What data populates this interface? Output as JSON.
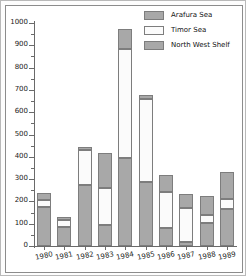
{
  "chart_data": {
    "type": "bar",
    "stacked": true,
    "title": "",
    "subtitle": "",
    "xlabel": "",
    "ylabel": "",
    "categories": [
      "1980",
      "1981",
      "1982",
      "1983",
      "1984",
      "1985",
      "1986",
      "1987",
      "1988",
      "1989"
    ],
    "series": [
      {
        "name": "North West Shelf",
        "color": "#a8a8a8",
        "values": [
          175,
          85,
          275,
          95,
          395,
          288,
          80,
          18,
          105,
          165
        ]
      },
      {
        "name": "Timor Sea",
        "color": "#fbfbfb",
        "values": [
          30,
          30,
          155,
          163,
          490,
          370,
          162,
          152,
          35,
          47
        ]
      },
      {
        "name": "Arafura Sea",
        "color": "#a8a8a8",
        "values": [
          33,
          17,
          12,
          157,
          90,
          17,
          76,
          63,
          85,
          118
        ]
      }
    ],
    "cumulative_tops": {
      "north_west_shelf": [
        175,
        85,
        275,
        95,
        395,
        288,
        80,
        18,
        105,
        165
      ],
      "timor_sea": [
        205,
        115,
        430,
        258,
        885,
        658,
        242,
        170,
        140,
        212
      ],
      "arafura_sea": [
        238,
        132,
        442,
        415,
        975,
        675,
        318,
        233,
        225,
        330
      ]
    },
    "ylim": [
      0,
      1050
    ],
    "y_ticks": [
      0,
      100,
      200,
      300,
      400,
      500,
      600,
      700,
      800,
      900,
      1000
    ],
    "y_minor_ticks": [
      50,
      150,
      250,
      350,
      450,
      550,
      650,
      750,
      850,
      950,
      1025
    ],
    "grid": false,
    "legend_position": "top-right",
    "legend_order": [
      "Arafura Sea",
      "Timor Sea",
      "North West Shelf"
    ]
  },
  "axis": {
    "y_tick_labels": [
      "0",
      "100",
      "200",
      "300",
      "400",
      "500",
      "600",
      "700",
      "800",
      "900",
      "1000"
    ],
    "x_tick_labels": [
      "1980",
      "1981",
      "1982",
      "1983",
      "1984",
      "1985",
      "1986",
      "1987",
      "1988",
      "1989"
    ]
  },
  "legend": {
    "items": [
      {
        "label": "Arafura Sea",
        "swatch": "#a8a8a8"
      },
      {
        "label": "Timor Sea",
        "swatch": "#fbfbfb"
      },
      {
        "label": "North West Shelf",
        "swatch": "#a8a8a8"
      }
    ]
  },
  "colors": {
    "north_west_shelf": "#a8a8a8",
    "timor_sea": "#fbfbfb",
    "arafura_sea": "#a8a8a8",
    "axis": "#6a6a6a",
    "border": "#8c8c8c",
    "text": "#1a1a1a"
  }
}
